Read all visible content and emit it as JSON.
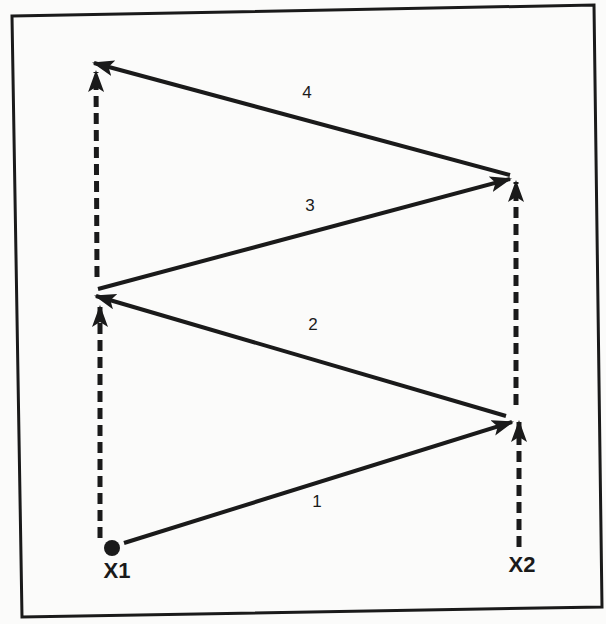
{
  "colors": {
    "stroke": "#1a1a1a",
    "background": "#fbfbfa"
  },
  "points": {
    "x1": {
      "label": "X1"
    },
    "x2": {
      "label": "X2"
    }
  },
  "paths": [
    {
      "id": "1",
      "label": "1",
      "from": [
        124,
        543
      ],
      "to": [
        512,
        422
      ],
      "style": "solid"
    },
    {
      "id": "2",
      "label": "2",
      "from": [
        506,
        416
      ],
      "to": [
        96,
        296
      ],
      "style": "solid"
    },
    {
      "id": "3",
      "label": "3",
      "from": [
        98,
        289
      ],
      "to": [
        510,
        179
      ],
      "style": "solid"
    },
    {
      "id": "4",
      "label": "4",
      "from": [
        510,
        175
      ],
      "to": [
        94,
        63
      ],
      "style": "solid"
    }
  ],
  "movements": [
    {
      "id": "x1-lower",
      "from": [
        100,
        538
      ],
      "to": [
        100,
        305
      ],
      "style": "dashed"
    },
    {
      "id": "x1-upper",
      "from": [
        97,
        277
      ],
      "to": [
        96,
        70
      ],
      "style": "dashed"
    },
    {
      "id": "x2-lower",
      "from": [
        519,
        547
      ],
      "to": [
        519,
        420
      ],
      "style": "dashed"
    },
    {
      "id": "x2-upper",
      "from": [
        516,
        405
      ],
      "to": [
        516,
        180
      ],
      "style": "dashed"
    }
  ]
}
